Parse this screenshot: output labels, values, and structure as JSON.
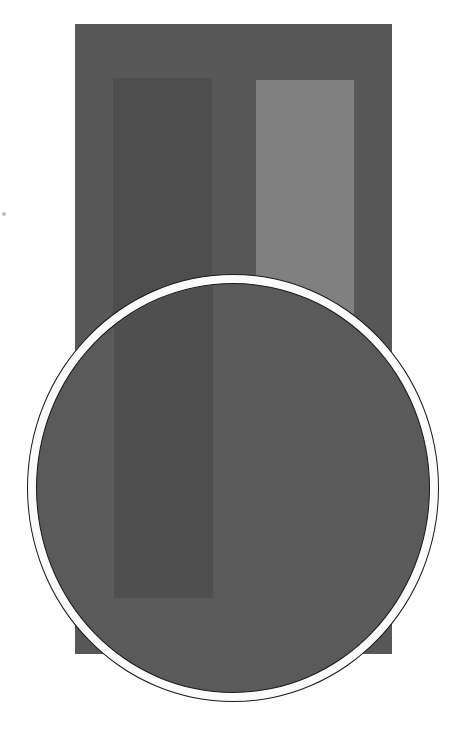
{
  "figure": {
    "colors": {
      "background": "#ffffff",
      "surround": "#585858",
      "left_patch": "#4e4e4e",
      "right_patch": "#808080",
      "lens_interior": "#5a5a5a",
      "lens_left_patch": "#4f4f4f",
      "lens_ring": "#fbfbfb",
      "lens_outline": "#1a1a1a"
    }
  }
}
